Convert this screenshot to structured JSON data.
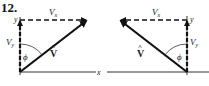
{
  "problem_number": "12.",
  "left_diagram": {
    "axis_x_label": "x",
    "axis_y_label": "y",
    "component_x_label": "V",
    "component_x_sub": "x",
    "component_y_label": "V",
    "component_y_sub": "y",
    "vector_label": "V",
    "vector_hat": "^",
    "angle_label": "ϕ"
  },
  "right_diagram": {
    "axis_y_label": "y",
    "component_x_label": "V",
    "component_x_sub": "x",
    "component_y_label": "V",
    "component_y_sub": "y",
    "vector_label": "V",
    "vector_hat": "^",
    "angle_label": "ϕ"
  }
}
